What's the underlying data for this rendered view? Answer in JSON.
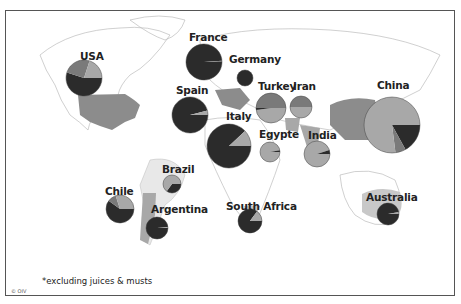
{
  "map": {
    "title": "",
    "footnote": "*excluding juices & musts",
    "copyright": "© OIV",
    "colors": {
      "dark": "#2b2b2b",
      "medium": "#7a7a7a",
      "light": "#a8a8a8",
      "land_highlight": "#8c8c8c",
      "land_light": "#c8c8c8",
      "border": "#555555"
    }
  },
  "chart_data": {
    "type": "pie",
    "title": "",
    "note": "*excluding juices & musts",
    "series_names": [
      "dark",
      "medium",
      "light"
    ],
    "countries": [
      {
        "name": "USA",
        "cx": 84,
        "cy": 78,
        "r": 18,
        "slices": [
          {
            "series": "dark",
            "value": 55
          },
          {
            "series": "medium",
            "value": 25
          },
          {
            "series": "light",
            "value": 20
          }
        ]
      },
      {
        "name": "France",
        "cx": 204,
        "cy": 62,
        "r": 18,
        "slices": [
          {
            "series": "dark",
            "value": 99
          },
          {
            "series": "medium",
            "value": 1
          }
        ]
      },
      {
        "name": "Germany",
        "cx": 245,
        "cy": 78,
        "r": 8,
        "slices": [
          {
            "series": "dark",
            "value": 100
          }
        ]
      },
      {
        "name": "Spain",
        "cx": 190,
        "cy": 115,
        "r": 18,
        "slices": [
          {
            "series": "dark",
            "value": 96
          },
          {
            "series": "light",
            "value": 4
          }
        ]
      },
      {
        "name": "Italy",
        "cx": 229,
        "cy": 146,
        "r": 22,
        "slices": [
          {
            "series": "dark",
            "value": 88
          },
          {
            "series": "light",
            "value": 12
          }
        ]
      },
      {
        "name": "Turkey",
        "cx": 271,
        "cy": 108,
        "r": 15,
        "slices": [
          {
            "series": "light",
            "value": 48
          },
          {
            "series": "dark",
            "value": 2
          },
          {
            "series": "medium",
            "value": 50
          }
        ]
      },
      {
        "name": "Iran",
        "cx": 301,
        "cy": 107,
        "r": 11,
        "slices": [
          {
            "series": "light",
            "value": 50
          },
          {
            "series": "medium",
            "value": 50
          }
        ]
      },
      {
        "name": "Egypte",
        "cx": 270,
        "cy": 152,
        "r": 10,
        "slices": [
          {
            "series": "light",
            "value": 97
          },
          {
            "series": "dark",
            "value": 3
          }
        ]
      },
      {
        "name": "India",
        "cx": 317,
        "cy": 154,
        "r": 13,
        "slices": [
          {
            "series": "light",
            "value": 95
          },
          {
            "series": "dark",
            "value": 5
          }
        ]
      },
      {
        "name": "China",
        "cx": 392,
        "cy": 125,
        "r": 28,
        "slices": [
          {
            "series": "dark",
            "value": 17
          },
          {
            "series": "medium",
            "value": 6
          },
          {
            "series": "light",
            "value": 77
          }
        ]
      },
      {
        "name": "Brazil",
        "cx": 172,
        "cy": 184,
        "r": 9,
        "slices": [
          {
            "series": "dark",
            "value": 35
          },
          {
            "series": "light",
            "value": 65
          }
        ]
      },
      {
        "name": "Chile",
        "cx": 120,
        "cy": 209,
        "r": 14,
        "slices": [
          {
            "series": "dark",
            "value": 60
          },
          {
            "series": "medium",
            "value": 10
          },
          {
            "series": "light",
            "value": 30
          }
        ]
      },
      {
        "name": "Argentina",
        "cx": 157,
        "cy": 228,
        "r": 11,
        "slices": [
          {
            "series": "dark",
            "value": 99
          },
          {
            "series": "light",
            "value": 1
          }
        ]
      },
      {
        "name": "South Africa",
        "cx": 250,
        "cy": 221,
        "r": 12,
        "slices": [
          {
            "series": "dark",
            "value": 85
          },
          {
            "series": "light",
            "value": 15
          }
        ]
      },
      {
        "name": "Australia",
        "cx": 388,
        "cy": 214,
        "r": 11,
        "slices": [
          {
            "series": "dark",
            "value": 97
          },
          {
            "series": "light",
            "value": 3
          }
        ]
      }
    ]
  },
  "labels": [
    {
      "text": "USA",
      "x": 80,
      "y": 50
    },
    {
      "text": "France",
      "x": 189,
      "y": 31
    },
    {
      "text": "Germany",
      "x": 229,
      "y": 53
    },
    {
      "text": "Spain",
      "x": 176,
      "y": 84
    },
    {
      "text": "Italy",
      "x": 226,
      "y": 110
    },
    {
      "text": "Turkey",
      "x": 258,
      "y": 80
    },
    {
      "text": "Iran",
      "x": 293,
      "y": 80
    },
    {
      "text": "Egypte",
      "x": 259,
      "y": 128
    },
    {
      "text": "India",
      "x": 308,
      "y": 129
    },
    {
      "text": "China",
      "x": 377,
      "y": 79
    },
    {
      "text": "Brazil",
      "x": 162,
      "y": 163
    },
    {
      "text": "Chile",
      "x": 105,
      "y": 185
    },
    {
      "text": "Argentina",
      "x": 151,
      "y": 203
    },
    {
      "text": "South Africa",
      "x": 226,
      "y": 200
    },
    {
      "text": "Australia",
      "x": 366,
      "y": 191
    }
  ]
}
